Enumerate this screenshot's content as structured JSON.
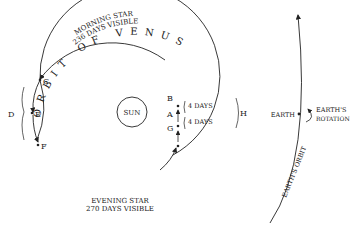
{
  "diagram": {
    "sun_label": "SUN",
    "venus_orbit_label": "ORBIT OF VENUS",
    "morning_star": {
      "line1": "MORNING STAR",
      "line2": "236 DAYS VISIBLE"
    },
    "evening_star": {
      "line1": "EVENING STAR",
      "line2": "270 DAYS VISIBLE"
    },
    "points": {
      "A": "A",
      "B": "B",
      "C": "C",
      "D": "D",
      "E": "E",
      "F": "F",
      "G": "G",
      "H": "H"
    },
    "interval_top": "4 DAYS",
    "interval_bottom": "4 DAYS",
    "earth_label": "EARTH",
    "earth_rotation_line1": "EARTH'S",
    "earth_rotation_line2": "ROTATION",
    "earth_orbit_label": "EARTH'S ORBIT",
    "colors": {
      "ink": "#222222",
      "background": "#ffffff"
    }
  }
}
